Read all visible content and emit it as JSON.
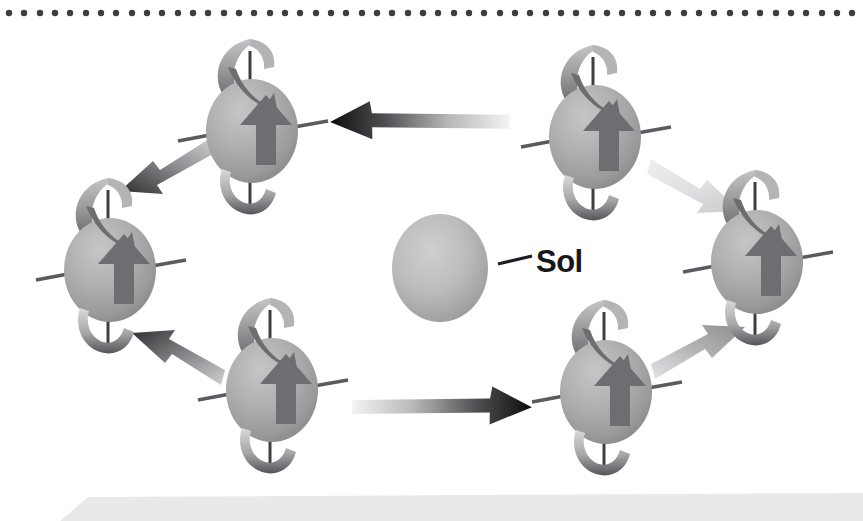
{
  "figure": {
    "background_color": "#ffffff",
    "width": 863,
    "height": 521,
    "labels": [
      {
        "id": "sol",
        "text": "Sol",
        "x": 536,
        "y": 272,
        "color": "#17171a"
      }
    ],
    "top_dotted_rule": {
      "name": "dotted-rule",
      "color": "#3d3d42",
      "dot_radius": 3.2,
      "dot_count": 56,
      "start_x": 9,
      "spacing": 15.35,
      "y": 13
    },
    "bottom_bar": {
      "name": "caption-bar",
      "color": "#e9e9eb",
      "x": 60,
      "y": 497,
      "width": 803,
      "height": 24
    },
    "central_body": {
      "name": "sol",
      "label": "Sol",
      "cx": 440,
      "cy": 268,
      "rx": 48,
      "ry": 54,
      "fill_light": "#c9c9c9",
      "fill_dark": "#8f8f8f",
      "leader_line": {
        "x1": 498,
        "y1": 262,
        "x2": 530,
        "y2": 254
      }
    },
    "planet_style": {
      "sphere_light": "#bdbdbd",
      "sphere_mid": "#a9a9a9",
      "sphere_dark": "#868686",
      "axis_color": "#5a5a5f",
      "spin_arrow_color": "#6e6e73",
      "face_arrow_color": "#6d6d72",
      "radius_x": 46,
      "radius_y": 52
    },
    "planets": [
      {
        "name": "planet-top-left",
        "position": "top-left",
        "cx": 252,
        "cy": 131
      },
      {
        "name": "planet-top-right",
        "position": "top-right",
        "cx": 595,
        "cy": 137
      },
      {
        "name": "planet-middle-left",
        "position": "middle-left",
        "cx": 110,
        "cy": 270
      },
      {
        "name": "planet-middle-right",
        "position": "middle-right",
        "cx": 757,
        "cy": 262
      },
      {
        "name": "planet-bottom-left",
        "position": "bottom-left",
        "cx": 272,
        "cy": 390
      },
      {
        "name": "planet-bottom-right",
        "position": "bottom-right",
        "cx": 606,
        "cy": 392
      }
    ],
    "orbit_arrows": [
      {
        "name": "orbit-arrow-top",
        "direction": "left",
        "from": "top-right",
        "to": "top-left",
        "head_color": "#0d0d0d",
        "tail_color": "#f2f2f2"
      },
      {
        "name": "orbit-arrow-upper-left",
        "direction": "down-left",
        "from": "top-left",
        "to": "middle-left",
        "head_color": "#2b2b2e",
        "tail_color": "#b9b9bb"
      },
      {
        "name": "orbit-arrow-lower-left",
        "direction": "up-left",
        "from": "bottom-left",
        "to": "middle-left",
        "head_color": "#303033",
        "tail_color": "#c2c2c4"
      },
      {
        "name": "orbit-arrow-bottom",
        "direction": "right",
        "from": "bottom-left",
        "to": "bottom-right",
        "head_color": "#0d0d0d",
        "tail_color": "#f2f2f2"
      },
      {
        "name": "orbit-arrow-lower-right",
        "direction": "up-right",
        "from": "bottom-right",
        "to": "middle-right",
        "head_color": "#8d8d90",
        "tail_color": "#dcdcde"
      },
      {
        "name": "orbit-arrow-upper-right",
        "direction": "down-right",
        "from": "top-right",
        "to": "middle-right",
        "head_color": "#d6d6d8",
        "tail_color": "#ededef"
      }
    ]
  }
}
